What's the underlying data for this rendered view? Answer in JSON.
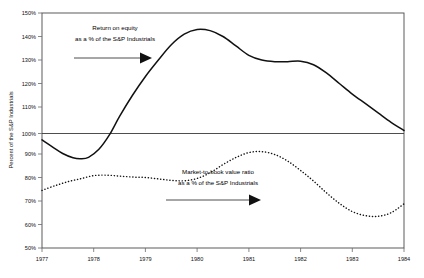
{
  "chart_data": {
    "type": "line",
    "title": "",
    "xlabel": "",
    "ylabel": "Percent of the S&P Industrials",
    "xlim": [
      1977,
      1984
    ],
    "ylim": [
      50,
      150
    ],
    "grid": false,
    "legend_position": "none",
    "y_tick_labels": [
      "150%",
      "140%",
      "130%",
      "120%",
      "110%",
      "100%",
      "90%",
      "80%",
      "70%",
      "60%",
      "50%"
    ],
    "y_tick_values": [
      150,
      140,
      130,
      120,
      110,
      100,
      90,
      80,
      70,
      60,
      50
    ],
    "x_tick_labels": [
      "1977",
      "1978",
      "1979",
      "1980",
      "1981",
      "1982",
      "1983",
      "1984"
    ],
    "x_tick_values": [
      1977,
      1978,
      1979,
      1980,
      1981,
      1982,
      1983,
      1984
    ],
    "reference_line": {
      "value": 100,
      "label": "100%"
    },
    "series": [
      {
        "name": "Return on equity as a % of the S&P Industrials",
        "style": "solid",
        "color": "#111111",
        "x": [
          1977.0,
          1977.2,
          1977.4,
          1977.6,
          1977.75,
          1977.9,
          1978.1,
          1978.3,
          1978.5,
          1978.75,
          1979.0,
          1979.25,
          1979.5,
          1979.75,
          1980.0,
          1980.25,
          1980.5,
          1980.75,
          1981.0,
          1981.25,
          1981.5,
          1981.75,
          1982.0,
          1982.25,
          1982.5,
          1982.75,
          1983.0,
          1983.25,
          1983.5,
          1983.75,
          1984.0
        ],
        "values": [
          96.0,
          93.0,
          90.2,
          88.4,
          88.0,
          88.6,
          92.0,
          98.0,
          106.0,
          115.0,
          123.0,
          130.0,
          136.5,
          141.0,
          143.0,
          142.5,
          140.0,
          136.0,
          132.0,
          130.0,
          129.3,
          129.3,
          129.5,
          128.0,
          124.5,
          120.0,
          115.5,
          111.5,
          107.5,
          103.5,
          100.0
        ]
      },
      {
        "name": "Market-to-book value ratio as a % of the S&P Industrials",
        "style": "dotted",
        "color": "#111111",
        "x": [
          1977.0,
          1977.25,
          1977.5,
          1977.75,
          1978.0,
          1978.25,
          1978.5,
          1978.75,
          1979.0,
          1979.25,
          1979.5,
          1979.75,
          1980.0,
          1980.25,
          1980.5,
          1980.75,
          1981.0,
          1981.25,
          1981.5,
          1981.75,
          1982.0,
          1982.25,
          1982.5,
          1982.75,
          1983.0,
          1983.25,
          1983.5,
          1983.75,
          1984.0
        ],
        "values": [
          74.5,
          76.5,
          78.2,
          79.5,
          80.8,
          81.0,
          80.6,
          80.2,
          80.0,
          79.4,
          78.8,
          78.6,
          79.6,
          82.0,
          85.5,
          88.5,
          90.6,
          91.0,
          89.8,
          87.0,
          83.0,
          78.5,
          73.5,
          69.0,
          65.5,
          63.8,
          63.5,
          65.0,
          68.8
        ]
      }
    ],
    "annotations": [
      {
        "id": "roe-annotation",
        "line1": "Return on equity",
        "line2": "as a % of the S&P Industrials",
        "arrow": "right-arrow"
      },
      {
        "id": "mtb-annotation",
        "line1": "Market-to-book value ratio",
        "line2": "as a % of the S&P Industrials",
        "arrow": "right-arrow"
      }
    ]
  }
}
